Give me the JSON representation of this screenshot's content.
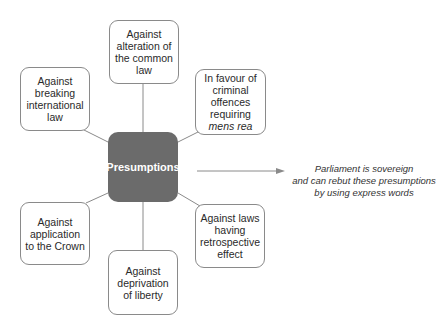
{
  "diagram": {
    "type": "mind-map",
    "center": {
      "label": "Presumptions",
      "color": "#6b6b6b"
    },
    "nodes": [
      {
        "id": "top",
        "label": "Against\nalteration of\nthe common\nlaw"
      },
      {
        "id": "top-left",
        "label": "Against\nbreaking\ninternational\nlaw"
      },
      {
        "id": "top-right",
        "label_main": "In favour of\ncriminal\noffences\nrequiring",
        "label_italic": "mens rea"
      },
      {
        "id": "bottom-left",
        "label": "Against\napplication\nto the Crown"
      },
      {
        "id": "bottom-right",
        "label": "Against laws\nhaving\nretrospective\neffect"
      },
      {
        "id": "bottom",
        "label": "Against\ndeprivation\nof liberty"
      }
    ],
    "note": {
      "line1": "Parliament is sovereign",
      "line2": "and can rebut these presumptions",
      "line3": "by using express words"
    },
    "colors": {
      "line": "#8a8a8a",
      "border": "#8a8a8a",
      "arrow": "#8a8a8a"
    }
  }
}
